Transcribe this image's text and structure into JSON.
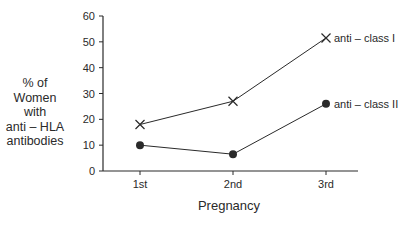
{
  "chart_data": {
    "type": "line",
    "title": "",
    "xlabel": "Pregnancy",
    "ylabel": "% of Women with anti–HLA antibodies",
    "ylabel_lines": [
      "% of",
      "Women",
      "with",
      "anti – HLA",
      "antibodies"
    ],
    "categories": [
      "1st",
      "2nd",
      "3rd"
    ],
    "ylim": [
      0,
      60
    ],
    "yticks": [
      0,
      10,
      20,
      30,
      40,
      50,
      60
    ],
    "grid": false,
    "legend_position": "inline-right",
    "series": [
      {
        "name": "anti – class  I",
        "marker": "x",
        "values": [
          18,
          27,
          51.5
        ]
      },
      {
        "name": "anti – class  II",
        "marker": "filled-circle",
        "values": [
          10,
          6.5,
          26
        ]
      }
    ]
  },
  "colors": {
    "ink": "#2a2a2a",
    "background": "#ffffff"
  }
}
